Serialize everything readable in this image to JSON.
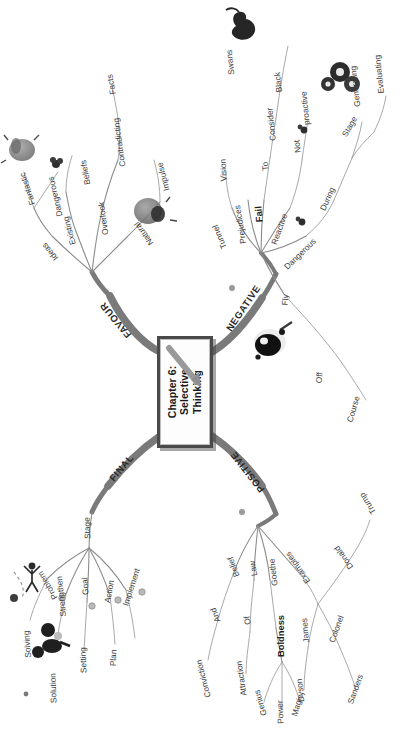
{
  "center": {
    "line1": "Chapter 6:",
    "line2": "Selective",
    "line3": "Thinking"
  },
  "colors": {
    "trunk": "#7a7a7a",
    "twig": "#8c8c8c",
    "text": "#3a3a3a",
    "center_border": "#4a4a4a",
    "background": "#ffffff"
  },
  "branches": {
    "favour": {
      "label": "FAVOUR",
      "nodes": [
        {
          "label": "Ideas",
          "children": [
            "Fantastic",
            "Dangerous"
          ]
        },
        {
          "label": "Existing",
          "children": [
            "Beliefs"
          ]
        },
        {
          "label": "Overlook",
          "children": [
            "Contradicting",
            "Facts"
          ]
        },
        {
          "label": "Natural",
          "children": [
            "Impulse"
          ]
        }
      ]
    },
    "negative": {
      "label": "NEGATIVE",
      "nodes": [
        {
          "label": "Tunnel",
          "children": [
            "Vision"
          ]
        },
        {
          "label": "Prejudices",
          "children": []
        },
        {
          "label": "Fail",
          "children": [
            "To",
            "Consider",
            "Black",
            "Swans"
          ]
        },
        {
          "label": "Reactive",
          "children": [
            "Not",
            "proactive"
          ]
        },
        {
          "label": "Dangerous",
          "children": [
            "During",
            "Stage",
            "Generating",
            "Evaluating"
          ]
        },
        {
          "label": "Fly",
          "children": [
            "Off",
            "Course"
          ]
        }
      ]
    },
    "final": {
      "label": "FINAL",
      "nodes": [
        {
          "label": "Stage",
          "children": [
            "Problem",
            "Solving",
            "Strengthen",
            "Solution",
            "Goal",
            "Setting",
            "Action",
            "Plan",
            "Implement"
          ]
        }
      ]
    },
    "positive": {
      "label": "POSITIVE",
      "nodes": [
        {
          "label": "Belief",
          "children": [
            "And",
            "Conviction"
          ]
        },
        {
          "label": "Law",
          "children": [
            "Of",
            "Attraction"
          ]
        },
        {
          "label": "Goethe",
          "children": [
            "Boldness",
            "Genius",
            "Power",
            "Magic"
          ]
        },
        {
          "label": "Examples",
          "children": [
            "James",
            "Dyson",
            "Colonel",
            "Sanders",
            "Donald",
            "Trump"
          ]
        }
      ]
    }
  },
  "labels": {
    "favour": "FAVOUR",
    "negative": "NEGATIVE",
    "final": "FINAL",
    "positive": "POSITIVE",
    "ideas": "Ideas",
    "fantastic": "Fantastic",
    "dangerous_f": "Dangerous",
    "existing": "Existing",
    "beliefs": "Beliefs",
    "overlook": "Overlook",
    "contradicting": "Contradicting",
    "facts": "Facts",
    "natural": "Natural",
    "impulse": "Impulse",
    "tunnel": "Tunnel",
    "vision": "Vision",
    "prejudices": "Prejudices",
    "fail": "Fail",
    "to": "To",
    "consider": "Consider",
    "black": "Black",
    "swans": "Swans",
    "reactive": "Reactive",
    "not": "Not",
    "proactive": "proactive",
    "dangerous_n": "Dangerous",
    "during": "During",
    "stage_n": "Stage",
    "generating": "Generating",
    "evaluating": "Evaluating",
    "fly": "Fly",
    "off": "Off",
    "course": "Course",
    "stage_f": "Stage",
    "problem": "Problem",
    "solving": "Solving",
    "strengthen": "Strengthen",
    "solution": "Solution",
    "goal": "Goal",
    "setting": "Setting",
    "action": "Action",
    "plan": "Plan",
    "implement": "Implement",
    "belief": "Belief",
    "and": "And",
    "conviction": "Conviction",
    "law": "Law",
    "of": "Of",
    "attraction": "Attraction",
    "goethe": "Goethe",
    "boldness": "Boldness",
    "genius": "Genius",
    "power": "Power",
    "magic": "Magic",
    "examples": "Examples",
    "james": "James",
    "dyson": "Dyson",
    "colonel": "Colonel",
    "sanders": "Sanders",
    "donald": "Donald",
    "trump": "Trump"
  },
  "images": [
    {
      "name": "lightbulb-ideas-image"
    },
    {
      "name": "person-thinking-image"
    },
    {
      "name": "black-swan-image"
    },
    {
      "name": "gears-image"
    },
    {
      "name": "dartboard-image"
    },
    {
      "name": "runner-image"
    },
    {
      "name": "puzzle-image"
    }
  ]
}
